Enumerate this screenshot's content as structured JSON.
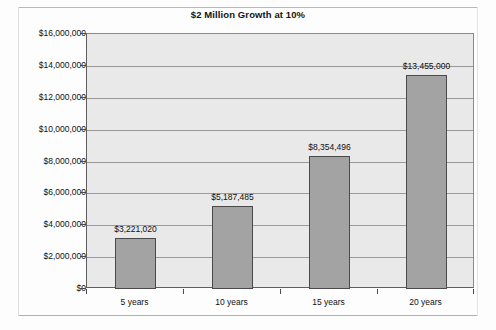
{
  "chart_data": {
    "type": "bar",
    "title": "$2 Million Growth at 10%",
    "xlabel": "",
    "ylabel": "",
    "categories": [
      "5 years",
      "10 years",
      "15 years",
      "20 years"
    ],
    "values": [
      3221020,
      5187485,
      8354496,
      13455000
    ],
    "data_labels": [
      "$3,221,020",
      "$5,187,485",
      "$8,354,496",
      "$13,455,000"
    ],
    "ylim": [
      0,
      16000000
    ],
    "ytick_values": [
      0,
      2000000,
      4000000,
      6000000,
      8000000,
      10000000,
      12000000,
      14000000,
      16000000
    ],
    "ytick_labels": [
      "$0",
      "$2,000,000",
      "$4,000,000",
      "$6,000,000",
      "$8,000,000",
      "$10,000,000",
      "$12,000,000",
      "$14,000,000",
      "$16,000,000"
    ],
    "grid": true,
    "legend": false,
    "legend_position": "none",
    "colors": {
      "bar_fill": "#a3a3a3",
      "bar_border": "#4b4b4b",
      "plot_background": "#e9e9e9",
      "gridline": "#9a9a9a",
      "axis": "#4a4a4a",
      "text": "#111111",
      "page_background": "#fdfdfd"
    }
  }
}
